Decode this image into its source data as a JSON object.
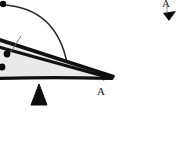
{
  "figure": {
    "type": "mechanical-diagram",
    "canvas": {
      "width": 177,
      "height": 161,
      "background": "#ffffff"
    },
    "labels": {
      "vertex_a": "A",
      "corner_a": "A"
    },
    "colors": {
      "outline": "#111111",
      "wedge_fill": "#e9e9e9",
      "arc": "#2b2b2b",
      "fulcrum": "#0d0d0d",
      "dot": "#0a0a0a",
      "leader": "#6f6f6f",
      "background": "#ffffff"
    },
    "geometry": {
      "wedge": {
        "name": "lever-wedge",
        "points": "-30,36 -26,30 10,41 112,76 104,80 -18,79 -28,72"
      },
      "wedge_top_edge": {
        "name": "wedge-upper-bar",
        "from": [
          -32,
          31
        ],
        "to": [
          112,
          76
        ]
      },
      "wedge_inner_edge": {
        "name": "wedge-inner-bar",
        "from": [
          -30,
          39
        ],
        "to": [
          110,
          78
        ]
      },
      "wedge_bottom_edge": {
        "name": "wedge-lower-bar",
        "from": [
          -28,
          78
        ],
        "to": [
          111,
          78
        ]
      },
      "arc": {
        "name": "swing-arc",
        "start": [
          3,
          5
        ],
        "control": [
          56,
          8
        ],
        "end": [
          67,
          63
        ]
      },
      "fulcrum": {
        "name": "fulcrum-triangle",
        "apex": [
          39,
          84
        ],
        "left": [
          31,
          105
        ],
        "right": [
          47,
          105
        ]
      },
      "corner_arrow": {
        "name": "corner-arrow-marker",
        "points": "163,14 175,12 170,21"
      },
      "dots": [
        {
          "name": "pivot-dot-top",
          "cx": 3,
          "cy": 4,
          "r": 3.2
        },
        {
          "name": "mass-dot-upper",
          "cx": 7,
          "cy": 54,
          "r": 3.4
        },
        {
          "name": "mass-dot-lower",
          "cx": 2,
          "cy": 67,
          "r": 3.4
        }
      ],
      "leader_line": {
        "name": "leader-line",
        "from": [
          21,
          36
        ],
        "to": [
          10,
          53
        ]
      }
    }
  }
}
